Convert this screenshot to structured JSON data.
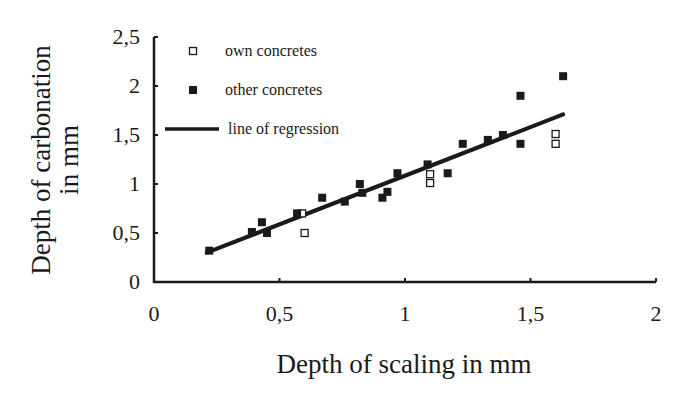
{
  "chart_data": {
    "type": "scatter",
    "title": "",
    "xlabel": "Depth of scaling in mm",
    "ylabel": [
      "Depth of carbonation",
      "in mm"
    ],
    "xlim": [
      0,
      2
    ],
    "ylim": [
      0,
      2.5
    ],
    "x_ticks": [
      0,
      0.5,
      1,
      1.5,
      2
    ],
    "x_tick_labels": [
      "0",
      "0,5",
      "1",
      "1,5",
      "2"
    ],
    "y_ticks": [
      0,
      0.5,
      1,
      1.5,
      2,
      2.5
    ],
    "y_tick_labels": [
      "0",
      "0,5",
      "1",
      "1,5",
      "2",
      "2,5"
    ],
    "grid": false,
    "legend_position": "upper-left",
    "series": [
      {
        "name": "own concretes",
        "marker": "hollow-square",
        "color": "#1a1a1a",
        "points": [
          [
            0.59,
            0.7
          ],
          [
            0.6,
            0.5
          ],
          [
            1.1,
            1.1
          ],
          [
            1.1,
            1.01
          ],
          [
            1.6,
            1.51
          ],
          [
            1.6,
            1.41
          ]
        ]
      },
      {
        "name": "other concretes",
        "marker": "filled-square",
        "color": "#1a1a1a",
        "points": [
          [
            0.22,
            0.32
          ],
          [
            0.39,
            0.51
          ],
          [
            0.43,
            0.61
          ],
          [
            0.45,
            0.5
          ],
          [
            0.57,
            0.7
          ],
          [
            0.67,
            0.86
          ],
          [
            0.76,
            0.82
          ],
          [
            0.82,
            1.0
          ],
          [
            0.83,
            0.91
          ],
          [
            0.91,
            0.86
          ],
          [
            0.93,
            0.92
          ],
          [
            0.97,
            1.11
          ],
          [
            1.09,
            1.2
          ],
          [
            1.17,
            1.11
          ],
          [
            1.23,
            1.41
          ],
          [
            1.33,
            1.45
          ],
          [
            1.39,
            1.5
          ],
          [
            1.46,
            1.9
          ],
          [
            1.46,
            1.41
          ],
          [
            1.63,
            2.1
          ]
        ]
      },
      {
        "name": "line of regression",
        "type": "line",
        "color": "#1a1a1a",
        "points": [
          [
            0.21,
            0.3
          ],
          [
            1.63,
            1.71
          ]
        ]
      }
    ],
    "legend": [
      {
        "label": "own concretes",
        "marker": "hollow-square"
      },
      {
        "label": "other concretes",
        "marker": "filled-square"
      },
      {
        "label": "line of regression",
        "marker": "line"
      }
    ]
  }
}
